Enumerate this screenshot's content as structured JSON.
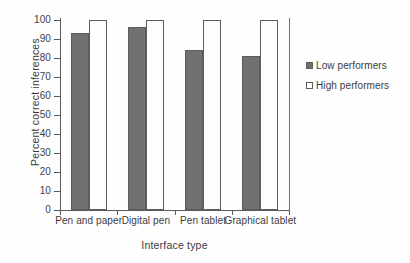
{
  "chart_data": {
    "type": "bar",
    "title": "",
    "xlabel": "Interface type",
    "ylabel": "Percent correct inferences",
    "categories": [
      "Pen and paper",
      "Digital pen",
      "Pen tablet",
      "Graphical tablet"
    ],
    "series": [
      {
        "name": "Low performers",
        "values": [
          93,
          96.5,
          84,
          81
        ],
        "color": "#717171"
      },
      {
        "name": "High performers",
        "values": [
          100,
          100,
          100,
          100
        ],
        "color": "#ffffff"
      }
    ],
    "ylim": [
      0,
      100
    ],
    "ytick_labels": [
      "100",
      "90",
      "80",
      "70",
      "60",
      "50",
      "40",
      "30",
      "20",
      "10",
      "0"
    ],
    "ytick_values": [
      100,
      90,
      80,
      70,
      60,
      50,
      40,
      30,
      20,
      10,
      0
    ],
    "ytick_step": 10,
    "grid": false,
    "legend_position": "right",
    "legend": [
      {
        "label": "Low performers",
        "marker": "filled-square"
      },
      {
        "label": "High performers",
        "marker": "open-square"
      }
    ]
  }
}
